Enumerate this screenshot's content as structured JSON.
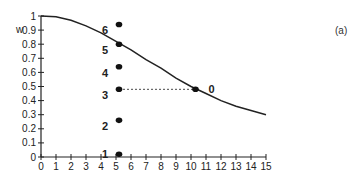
{
  "panel_label": "(a)",
  "chart_data": {
    "type": "line",
    "title": "",
    "xlabel": "",
    "ylabel": "w",
    "xlim": [
      0,
      15
    ],
    "ylim": [
      0,
      1
    ],
    "x_ticks": [
      0,
      1,
      2,
      3,
      4,
      5,
      6,
      7,
      8,
      9,
      10,
      11,
      12,
      13,
      14,
      15
    ],
    "y_ticks": [
      0,
      0.1,
      0.2,
      0.3,
      0.4,
      0.5,
      0.6,
      0.7,
      0.8,
      0.9,
      1
    ],
    "grid": false,
    "curve": {
      "name": "w curve",
      "x": [
        0,
        1,
        2,
        3,
        4,
        5,
        6,
        7,
        8,
        9,
        10,
        11,
        12,
        13,
        14,
        15
      ],
      "y": [
        1.0,
        0.995,
        0.97,
        0.93,
        0.88,
        0.82,
        0.76,
        0.69,
        0.63,
        0.56,
        0.5,
        0.45,
        0.4,
        0.36,
        0.33,
        0.3
      ]
    },
    "points": [
      {
        "label": "1",
        "x": 5.2,
        "y": 0.02
      },
      {
        "label": "2",
        "x": 5.2,
        "y": 0.26
      },
      {
        "label": "3",
        "x": 5.2,
        "y": 0.48
      },
      {
        "label": "4",
        "x": 5.2,
        "y": 0.64
      },
      {
        "label": "5",
        "x": 5.2,
        "y": 0.8
      },
      {
        "label": "6",
        "x": 5.2,
        "y": 0.94
      },
      {
        "label": "0",
        "x": 10.3,
        "y": 0.48
      }
    ],
    "annotations": [
      {
        "type": "dashed-line",
        "from": [
          5.2,
          0.48
        ],
        "to": [
          10.3,
          0.48
        ]
      }
    ]
  }
}
